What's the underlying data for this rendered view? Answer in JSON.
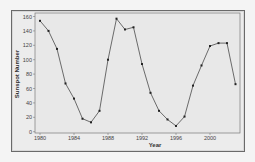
{
  "chart_data": {
    "type": "line",
    "title": "",
    "xlabel": "Year",
    "ylabel": "Sunspot Number",
    "x": [
      1980,
      1981,
      1982,
      1983,
      1984,
      1985,
      1986,
      1987,
      1988,
      1989,
      1990,
      1991,
      1992,
      1993,
      1994,
      1995,
      1996,
      1997,
      1998,
      1999,
      2000,
      2001,
      2002,
      2003
    ],
    "series": [
      {
        "name": "Sunspot Number",
        "values": [
          154,
          140,
          115,
          67,
          46,
          18,
          13,
          29,
          100,
          157,
          142,
          145,
          94,
          54,
          29,
          17,
          8,
          21,
          64,
          92,
          119,
          123,
          123,
          66
        ]
      }
    ],
    "xlim": [
      1980,
      2003
    ],
    "ylim": [
      0,
      160
    ],
    "xticks": [
      1980,
      1984,
      1988,
      1992,
      1996,
      2000
    ],
    "yticks": [
      0,
      20,
      40,
      60,
      80,
      100,
      120,
      140,
      160
    ],
    "grid": false,
    "legend": null,
    "marker": "square",
    "line_color": "#333333",
    "plot_bg": "#ececec"
  }
}
